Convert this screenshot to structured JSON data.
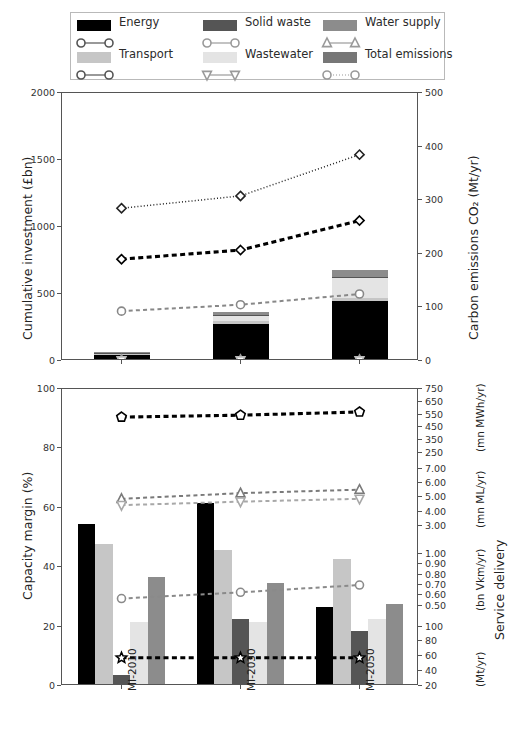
{
  "legend": {
    "items": [
      {
        "label": "Energy",
        "color": "#000000",
        "marker": "circle-open",
        "line": "solid-thin",
        "col": 0,
        "row": 0
      },
      {
        "label": "Solid waste",
        "color": "#555555",
        "marker": "circle-open",
        "line": "solid-thin",
        "col": 1,
        "row": 0
      },
      {
        "label": "Water supply",
        "color": "#8c8c8c",
        "marker": "triangle-up-open",
        "line": "solid-thin",
        "col": 2,
        "row": 0
      },
      {
        "label": "Transport",
        "color": "#c6c6c6",
        "marker": "circle-open",
        "line": "solid-thin",
        "col": 0,
        "row": 1
      },
      {
        "label": "Wastewater",
        "color": "#e4e4e4",
        "marker": "triangle-down-open",
        "line": "dashed-thin",
        "col": 1,
        "row": 1
      },
      {
        "label": "Total emissions",
        "color": "#777777",
        "marker": "circle-open",
        "line": "dotted",
        "col": 2,
        "row": 1
      }
    ]
  },
  "chart_data": [
    {
      "type": "bar",
      "id": "top",
      "title": "",
      "categories": [
        "MI-2010",
        "MI-2030",
        "MI-2050"
      ],
      "xlabel": "",
      "ylabel": "Cumulative investment (£bn)",
      "ylim": [
        0,
        2000
      ],
      "yticks": [
        0,
        500,
        1000,
        1500,
        2000
      ],
      "y2label": "Carbon emissions CO₂ (Mt/yr)",
      "y2lim": [
        0,
        500
      ],
      "y2ticks": [
        0,
        100,
        200,
        300,
        400,
        500
      ],
      "grid": false,
      "stacked": true,
      "series": [
        {
          "name": "Energy",
          "color": "#000000",
          "values": [
            30,
            265,
            430
          ]
        },
        {
          "name": "Transport",
          "color": "#c6c6c6",
          "values": [
            5,
            20,
            25
          ]
        },
        {
          "name": "Wastewater",
          "color": "#e4e4e4",
          "values": [
            8,
            35,
            150
          ]
        },
        {
          "name": "Solid waste",
          "color": "#555555",
          "values": [
            2,
            6,
            8
          ]
        },
        {
          "name": "Water supply",
          "color": "#8c8c8c",
          "values": [
            5,
            25,
            55
          ]
        }
      ],
      "lines": [
        {
          "name": "Total emissions",
          "axis": "right",
          "style": "dotted",
          "color": "#222222",
          "marker": "diamond-open",
          "values": [
            285,
            308,
            385
          ]
        },
        {
          "name": "Energy emissions",
          "axis": "right",
          "style": "dashed-thick",
          "color": "#000000",
          "marker": "diamond-open",
          "values": [
            190,
            207,
            262
          ]
        },
        {
          "name": "Transport emissions",
          "axis": "right",
          "style": "dashed",
          "color": "#888888",
          "marker": "circle-open",
          "values": [
            93,
            105,
            125
          ]
        },
        {
          "name": "Water supply emissions",
          "axis": "right",
          "style": "dashed",
          "color": "#9a9a9a",
          "marker": "triangle-up-open",
          "values": [
            2,
            2,
            2
          ]
        },
        {
          "name": "Wastewater emissions",
          "axis": "right",
          "style": "dashed",
          "color": "#bbbbbb",
          "marker": "triangle-down-open",
          "values": [
            1,
            1,
            1
          ]
        }
      ]
    },
    {
      "type": "bar",
      "id": "bottom",
      "title": "",
      "categories": [
        "MI-2010",
        "MI-2030",
        "MI-2050"
      ],
      "xlabel": "",
      "ylabel": "Capacity margin (%)",
      "ylim": [
        0,
        100
      ],
      "yticks": [
        0,
        20,
        40,
        60,
        80,
        100
      ],
      "y2label": "Service delivery",
      "y2groups": [
        {
          "unit": "(mn MWh/yr)",
          "ticks": [
            250,
            350,
            450,
            550,
            650,
            750
          ]
        },
        {
          "unit": "(mn ML/yr)",
          "ticks": [
            3.0,
            4.0,
            5.0,
            6.0,
            7.0
          ]
        },
        {
          "unit": "(bn Vkm/yr)",
          "ticks": [
            0.5,
            0.6,
            0.7,
            0.8,
            0.9,
            1.0
          ]
        },
        {
          "unit": "(Mt/yr)",
          "ticks": [
            20,
            40,
            60,
            80,
            100
          ]
        }
      ],
      "grid": false,
      "stacked": false,
      "series": [
        {
          "name": "Energy",
          "color": "#000000",
          "values": [
            54,
            61,
            26
          ]
        },
        {
          "name": "Transport",
          "color": "#c6c6c6",
          "values": [
            47,
            45,
            42
          ]
        },
        {
          "name": "Solid waste",
          "color": "#555555",
          "values": [
            3,
            22,
            18
          ]
        },
        {
          "name": "Wastewater",
          "color": "#e4e4e4",
          "values": [
            21,
            21,
            22
          ]
        },
        {
          "name": "Water supply",
          "color": "#8c8c8c",
          "values": [
            36,
            34,
            27
          ]
        }
      ],
      "lines": [
        {
          "name": "Energy delivery",
          "axis": "mwh",
          "style": "dashed-thick",
          "color": "#000000",
          "marker": "pentagon-open",
          "values": [
            530,
            545,
            570
          ]
        },
        {
          "name": "Water supply delivery",
          "axis": "ml",
          "style": "dashed",
          "color": "#7a7a7a",
          "marker": "triangle-up-open",
          "values": [
            4.9,
            5.3,
            5.55
          ]
        },
        {
          "name": "Wastewater delivery",
          "axis": "ml",
          "style": "dashed",
          "color": "#a8a8a8",
          "marker": "triangle-down-open",
          "values": [
            4.45,
            4.7,
            4.9
          ]
        },
        {
          "name": "Transport delivery",
          "axis": "vkm",
          "style": "dashed",
          "color": "#8a8a8a",
          "marker": "circle-open",
          "values": [
            0.57,
            0.63,
            0.7
          ]
        },
        {
          "name": "Solid waste delivery",
          "axis": "mt",
          "style": "dashed-thick",
          "color": "#000000",
          "marker": "star-open",
          "values": [
            58,
            58,
            58
          ]
        }
      ]
    }
  ]
}
